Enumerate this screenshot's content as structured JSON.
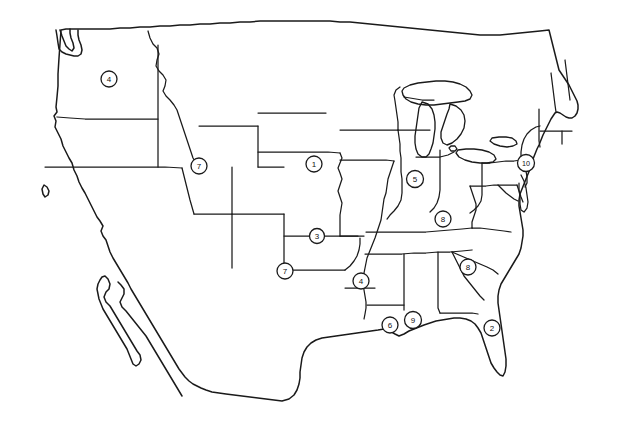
{
  "figure": {
    "background_color": "#ffffff",
    "line_color": "#1a1a1a",
    "marker_fill_color": "#ffffff",
    "width": 623,
    "height": 445
  },
  "markers": [
    {
      "label": "4",
      "x": 109,
      "y": 79,
      "r": 8.0,
      "region": "washington"
    },
    {
      "label": "7",
      "x": 199,
      "y": 166,
      "r": 8.0,
      "region": "nevada-utah-border"
    },
    {
      "label": "1",
      "x": 314,
      "y": 164,
      "r": 8.0,
      "region": "nebraska"
    },
    {
      "label": "5",
      "x": 415,
      "y": 179,
      "r": 8.5,
      "region": "indiana"
    },
    {
      "label": "10",
      "x": 526,
      "y": 163,
      "r": 8.5,
      "region": "new-jersey",
      "wide": true
    },
    {
      "label": "8",
      "x": 443,
      "y": 219,
      "r": 8.0,
      "region": "kentucky"
    },
    {
      "label": "3",
      "x": 317,
      "y": 236,
      "r": 7.5,
      "region": "kansas-oklahoma-border"
    },
    {
      "label": "7",
      "x": 285,
      "y": 271,
      "r": 8.0,
      "region": "texas-new-mexico-corner"
    },
    {
      "label": "4",
      "x": 361,
      "y": 281,
      "r": 8.0,
      "region": "louisiana-arkansas"
    },
    {
      "label": "8",
      "x": 468,
      "y": 267,
      "r": 8.0,
      "region": "south-carolina"
    },
    {
      "label": "6",
      "x": 390,
      "y": 325,
      "r": 8.0,
      "region": "louisiana-coast"
    },
    {
      "label": "9",
      "x": 413,
      "y": 320,
      "r": 8.5,
      "region": "mississippi-coast"
    },
    {
      "label": "2",
      "x": 492,
      "y": 328,
      "r": 8.0,
      "region": "florida"
    }
  ]
}
